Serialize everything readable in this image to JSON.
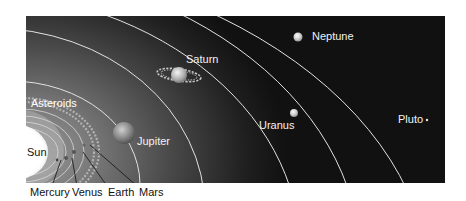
{
  "diagram": {
    "background_color": "#ffffff",
    "panel_colors": {
      "inner": "#9a9a9a",
      "outer": "#111111"
    },
    "orbit_color": "#e8e8e8",
    "bodies": {
      "sun": {
        "label": "Sun"
      },
      "asteroids": {
        "label": "Asteroids"
      },
      "jupiter": {
        "label": "Jupiter"
      },
      "saturn": {
        "label": "Saturn"
      },
      "uranus": {
        "label": "Uranus"
      },
      "neptune": {
        "label": "Neptune"
      },
      "pluto": {
        "label": "Pluto"
      }
    },
    "inner_planet_labels": [
      {
        "label": "Mercury"
      },
      {
        "label": "Venus"
      },
      {
        "label": "Earth"
      },
      {
        "label": "Mars"
      }
    ]
  }
}
